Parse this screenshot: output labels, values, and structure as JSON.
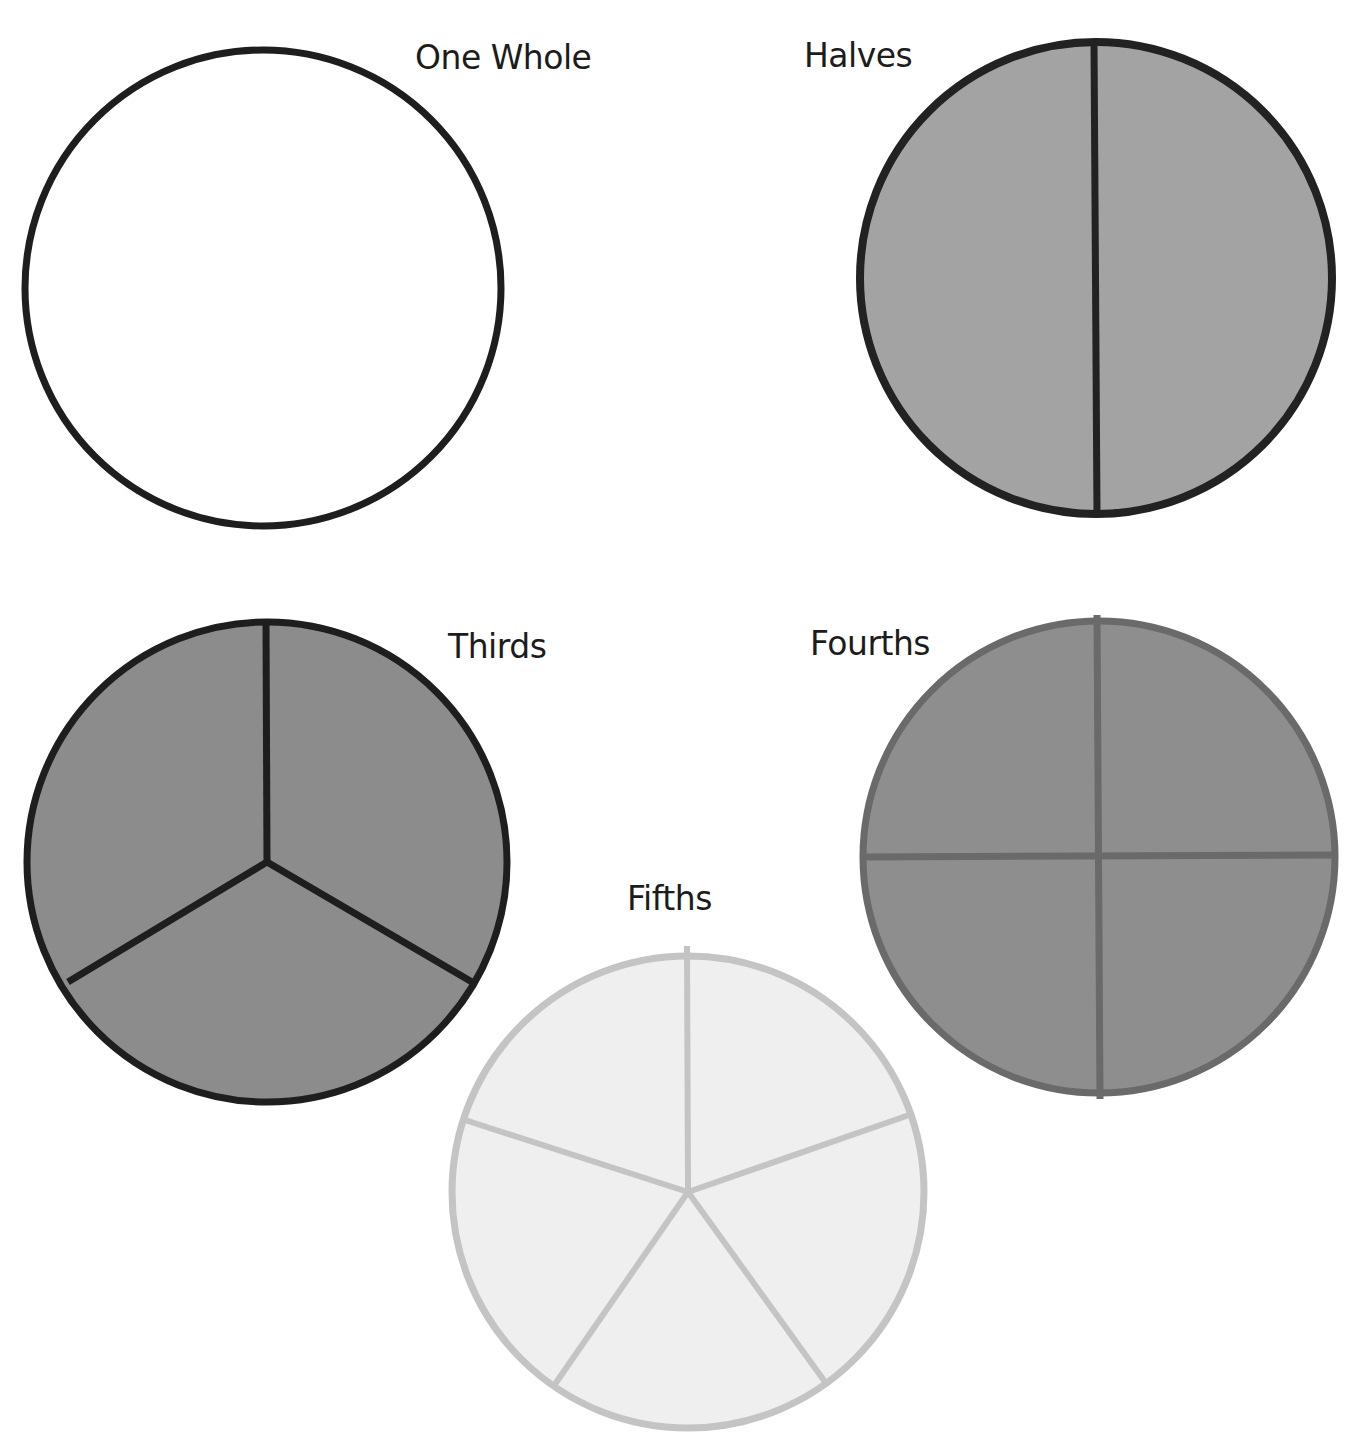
{
  "labels": {
    "whole": "One Whole",
    "halves": "Halves",
    "thirds": "Thirds",
    "fourths": "Fourths",
    "fifths": "Fifths"
  },
  "circles": [
    {
      "name": "One Whole",
      "parts": 1,
      "fill": "#ffffff",
      "stroke": "#1e1e1e",
      "cx": 263,
      "cy": 288,
      "r": 238
    },
    {
      "name": "Halves",
      "parts": 2,
      "fill": "#a3a3a3",
      "stroke": "#222222",
      "cx": 1096,
      "cy": 277,
      "r": 236
    },
    {
      "name": "Thirds",
      "parts": 3,
      "fill": "#8c8c8c",
      "stroke": "#1e1e1e",
      "cx": 267,
      "cy": 862,
      "r": 240
    },
    {
      "name": "Fourths",
      "parts": 4,
      "fill": "#8e8e8e",
      "stroke": "#6a6a6a",
      "cx": 1099,
      "cy": 857,
      "r": 236
    },
    {
      "name": "Fifths",
      "parts": 5,
      "fill": "#efefef",
      "stroke": "#c4c4c4",
      "cx": 688,
      "cy": 1192,
      "r": 236
    }
  ],
  "colors": {
    "background": "#ffffff",
    "text": "#1c1c1c"
  }
}
